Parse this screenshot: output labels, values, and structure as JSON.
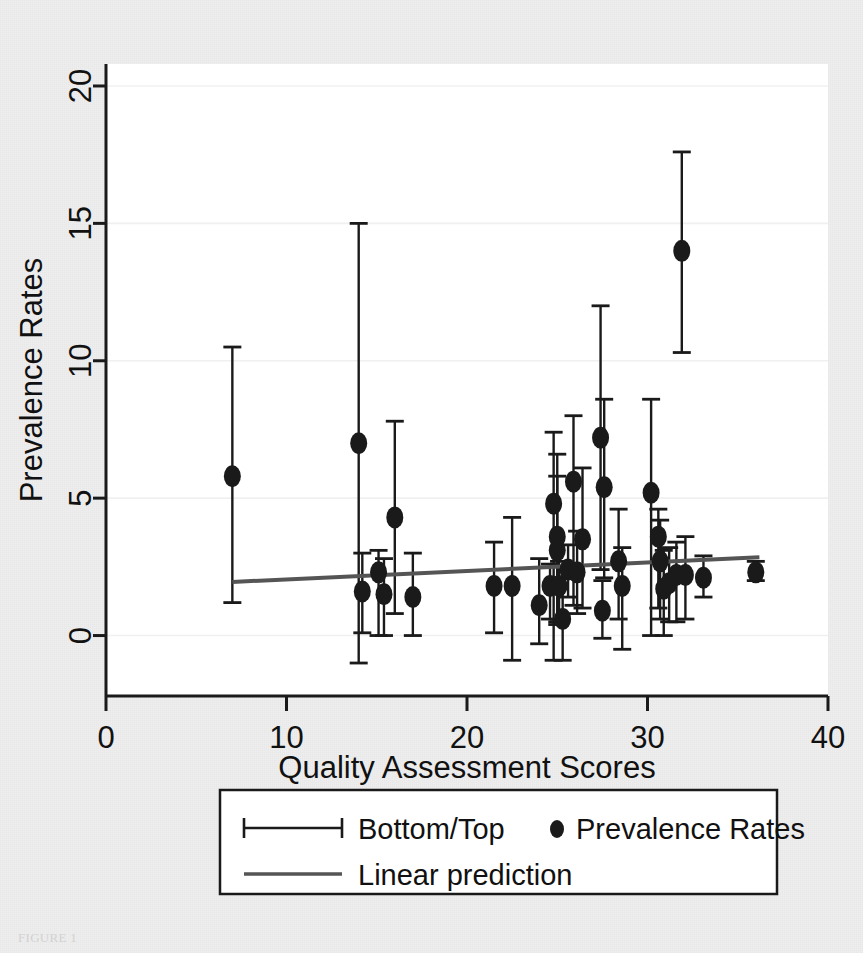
{
  "figure": {
    "caption": "FIGURE 1",
    "background_color": "#eeeeee",
    "plot_background_color": "#ffffff",
    "ink_color": "#1a1a1a",
    "gridline_color": "#f0f0f0",
    "regression_color": "#555555"
  },
  "chart_data": {
    "type": "scatter",
    "title": "",
    "subtitle": "",
    "xlabel": "Quality Assessment Scores",
    "ylabel": "Prevalence Rates",
    "xlim": [
      0,
      40
    ],
    "ylim": [
      -2.2,
      20.8
    ],
    "xticks": [
      0,
      10,
      20,
      30,
      40
    ],
    "yticks": [
      0,
      5,
      10,
      15,
      20
    ],
    "xtick_labels": [
      "0",
      "10",
      "20",
      "30",
      "40"
    ],
    "ytick_labels": [
      "0",
      "5",
      "10",
      "15",
      "20"
    ],
    "grid": "horizontal",
    "legend_position": "below-axis",
    "legend": [
      {
        "symbol": "error-bar",
        "label": "Bottom/Top"
      },
      {
        "symbol": "filled-circle",
        "label": "Prevalence Rates"
      },
      {
        "symbol": "line",
        "label": "Linear prediction"
      }
    ],
    "series": [
      {
        "name": "Prevalence Rates",
        "marker": "filled-circle",
        "error_bar_name": "Bottom/Top",
        "points": [
          {
            "x": 7.0,
            "y": 5.8,
            "lo": 1.2,
            "hi": 10.5
          },
          {
            "x": 14.0,
            "y": 7.0,
            "lo": -1.0,
            "hi": 15.0
          },
          {
            "x": 14.2,
            "y": 1.6,
            "lo": 0.1,
            "hi": 3.0
          },
          {
            "x": 15.1,
            "y": 2.3,
            "lo": 0.0,
            "hi": 3.1
          },
          {
            "x": 15.4,
            "y": 1.5,
            "lo": 0.0,
            "hi": 2.8
          },
          {
            "x": 16.0,
            "y": 4.3,
            "lo": 0.8,
            "hi": 7.8
          },
          {
            "x": 17.0,
            "y": 1.4,
            "lo": 0.0,
            "hi": 3.0
          },
          {
            "x": 21.5,
            "y": 1.8,
            "lo": 0.1,
            "hi": 3.4
          },
          {
            "x": 22.5,
            "y": 1.8,
            "lo": -0.9,
            "hi": 4.3
          },
          {
            "x": 24.0,
            "y": 1.1,
            "lo": -0.3,
            "hi": 2.8
          },
          {
            "x": 24.6,
            "y": 1.8,
            "lo": 0.6,
            "hi": 2.6
          },
          {
            "x": 24.8,
            "y": 4.8,
            "lo": -0.9,
            "hi": 7.4
          },
          {
            "x": 25.0,
            "y": 3.6,
            "lo": 0.5,
            "hi": 6.6
          },
          {
            "x": 25.0,
            "y": 3.1,
            "lo": 0.4,
            "hi": 5.8
          },
          {
            "x": 25.1,
            "y": 1.8,
            "lo": 0.5,
            "hi": 2.7
          },
          {
            "x": 25.3,
            "y": 0.6,
            "lo": -0.9,
            "hi": 2.1
          },
          {
            "x": 25.6,
            "y": 2.4,
            "lo": 1.4,
            "hi": 3.3
          },
          {
            "x": 25.9,
            "y": 5.6,
            "lo": 1.1,
            "hi": 8.0
          },
          {
            "x": 26.1,
            "y": 2.3,
            "lo": 0.8,
            "hi": 3.8
          },
          {
            "x": 26.4,
            "y": 3.5,
            "lo": 1.0,
            "hi": 6.1
          },
          {
            "x": 27.4,
            "y": 7.2,
            "lo": 2.4,
            "hi": 12.0
          },
          {
            "x": 27.6,
            "y": 5.4,
            "lo": 2.1,
            "hi": 8.6
          },
          {
            "x": 27.5,
            "y": 0.9,
            "lo": -0.1,
            "hi": 2.0
          },
          {
            "x": 28.4,
            "y": 2.7,
            "lo": 0.6,
            "hi": 4.6
          },
          {
            "x": 28.6,
            "y": 1.8,
            "lo": -0.5,
            "hi": 3.2
          },
          {
            "x": 30.2,
            "y": 5.2,
            "lo": 0.0,
            "hi": 8.6
          },
          {
            "x": 30.6,
            "y": 3.6,
            "lo": 1.0,
            "hi": 4.6
          },
          {
            "x": 30.7,
            "y": 2.7,
            "lo": 0.6,
            "hi": 4.2
          },
          {
            "x": 30.9,
            "y": 1.7,
            "lo": 0.0,
            "hi": 3.1
          },
          {
            "x": 31.2,
            "y": 1.9,
            "lo": 0.5,
            "hi": 3.2
          },
          {
            "x": 31.6,
            "y": 2.2,
            "lo": 0.5,
            "hi": 3.4
          },
          {
            "x": 31.9,
            "y": 14.0,
            "lo": 10.3,
            "hi": 17.6
          },
          {
            "x": 32.1,
            "y": 2.2,
            "lo": 0.6,
            "hi": 3.6
          },
          {
            "x": 33.1,
            "y": 2.1,
            "lo": 1.4,
            "hi": 2.9
          },
          {
            "x": 36.0,
            "y": 2.3,
            "lo": 2.0,
            "hi": 2.7
          }
        ]
      }
    ],
    "trendline": {
      "name": "Linear prediction",
      "x0": 7.0,
      "y0": 1.95,
      "x1": 36.2,
      "y1": 2.85
    }
  }
}
